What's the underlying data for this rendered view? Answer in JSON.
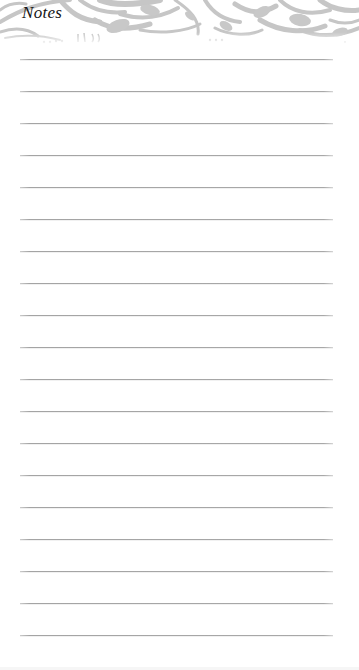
{
  "page": {
    "title": "Notes",
    "header_decoration": "gray-floral-damask-band",
    "colors": {
      "background": "#ffffff",
      "rule_line": "#a6a6a6",
      "damask": "#c4c4c4",
      "title_text": "#141414"
    },
    "lines": [
      {
        "y": 59,
        "text": ""
      },
      {
        "y": 91,
        "text": ""
      },
      {
        "y": 123,
        "text": ""
      },
      {
        "y": 155,
        "text": ""
      },
      {
        "y": 187,
        "text": ""
      },
      {
        "y": 219,
        "text": ""
      },
      {
        "y": 251,
        "text": ""
      },
      {
        "y": 283,
        "text": ""
      },
      {
        "y": 315,
        "text": ""
      },
      {
        "y": 347,
        "text": ""
      },
      {
        "y": 379,
        "text": ""
      },
      {
        "y": 411,
        "text": ""
      },
      {
        "y": 443,
        "text": ""
      },
      {
        "y": 475,
        "text": ""
      },
      {
        "y": 507,
        "text": ""
      },
      {
        "y": 539,
        "text": ""
      },
      {
        "y": 571,
        "text": ""
      },
      {
        "y": 603,
        "text": ""
      },
      {
        "y": 635,
        "text": ""
      }
    ]
  }
}
